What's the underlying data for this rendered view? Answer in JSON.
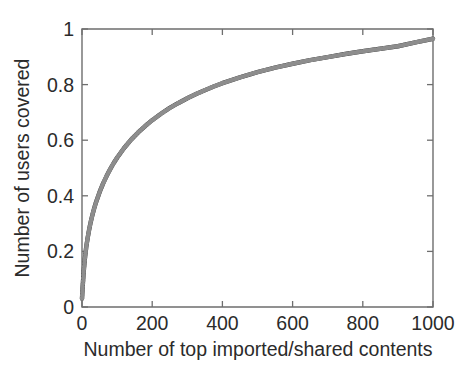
{
  "figure": {
    "background_color": "#ffffff",
    "axis_color": "#6e6e6e",
    "text_color": "#2b2b2b",
    "series_color": "#2e2e2e"
  },
  "axes": {
    "x_title": "Number of top imported/shared contents",
    "y_title": "Number of users covered",
    "x_tick_labels": [
      "0",
      "200",
      "400",
      "600",
      "800",
      "1000"
    ],
    "y_tick_labels": [
      "0",
      "0.2",
      "0.4",
      "0.6",
      "0.8",
      "1"
    ]
  },
  "chart_data": {
    "type": "line",
    "title": "",
    "subtitle": "",
    "xlabel": "Number of top imported/shared contents",
    "ylabel": "Number of users covered",
    "xlim": [
      0,
      1000
    ],
    "ylim": [
      0,
      1
    ],
    "xticks": [
      0,
      200,
      400,
      600,
      800,
      1000
    ],
    "yticks": [
      0,
      0.2,
      0.4,
      0.6,
      0.8,
      1
    ],
    "grid": false,
    "legend": null,
    "legend_position": "none",
    "annotations": [],
    "marker": "cross-dense",
    "series": [
      {
        "name": "Coverage",
        "x": [
          0,
          2,
          5,
          8,
          12,
          16,
          20,
          25,
          30,
          35,
          40,
          50,
          60,
          70,
          80,
          90,
          100,
          120,
          140,
          160,
          180,
          200,
          225,
          250,
          275,
          300,
          325,
          350,
          375,
          400,
          450,
          500,
          550,
          600,
          650,
          700,
          750,
          800,
          850,
          900,
          950,
          1000
        ],
        "y": [
          0.03,
          0.075,
          0.13,
          0.172,
          0.215,
          0.248,
          0.276,
          0.307,
          0.333,
          0.356,
          0.377,
          0.413,
          0.444,
          0.471,
          0.495,
          0.517,
          0.537,
          0.572,
          0.602,
          0.628,
          0.651,
          0.672,
          0.695,
          0.716,
          0.734,
          0.751,
          0.766,
          0.78,
          0.793,
          0.805,
          0.826,
          0.845,
          0.861,
          0.875,
          0.888,
          0.899,
          0.91,
          0.92,
          0.929,
          0.938,
          0.952,
          0.965
        ]
      }
    ]
  }
}
